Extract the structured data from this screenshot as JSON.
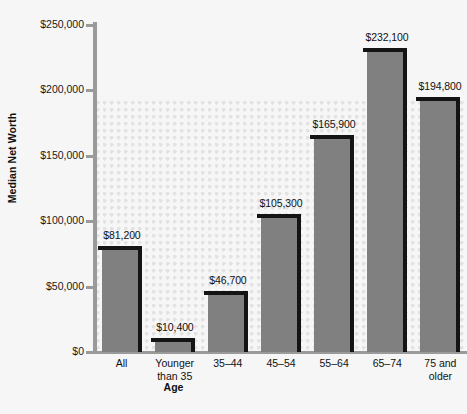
{
  "chart_data": {
    "type": "bar",
    "title": "",
    "xlabel": "Age",
    "ylabel": "Median Net Worth",
    "categories": [
      "All",
      "Younger\nthan 35",
      "35–44",
      "45–54",
      "55–64",
      "65–74",
      "75 and\nolder"
    ],
    "values": [
      81200,
      10400,
      46700,
      105300,
      165900,
      232100,
      194800
    ],
    "value_labels": [
      "$81,200",
      "$10,400",
      "$46,700",
      "$105,300",
      "$165,900",
      "$232,100",
      "$194,800"
    ],
    "ylim": [
      0,
      250000
    ],
    "ytick_values": [
      0,
      50000,
      100000,
      150000,
      200000,
      250000
    ],
    "ytick_labels": [
      "$0",
      "$50,000",
      "$100,000",
      "$150,000",
      "$200,000",
      "$250,000"
    ],
    "grid": false,
    "legend": null,
    "bar_color": "#808080",
    "bar_edge_color": "#141414",
    "axis_color": "#9a9a9a",
    "background_color": "#f6f6f6",
    "pattern_color": "#e3e3e3"
  }
}
